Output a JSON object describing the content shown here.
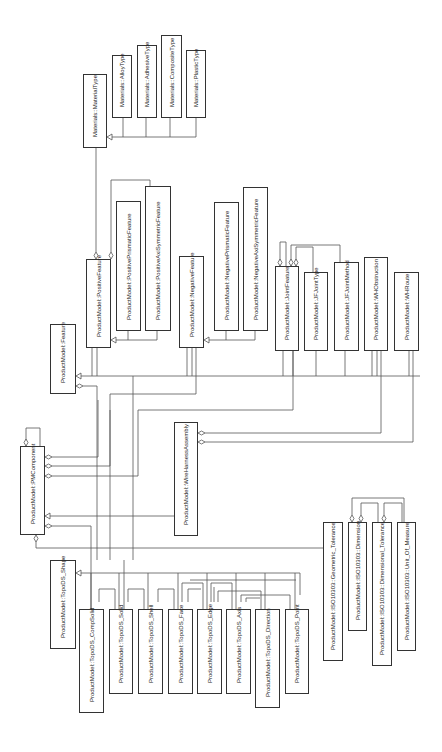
{
  "diagram": {
    "type": "UML class diagram (rotated 90 degrees)",
    "classes": [
      {
        "id": "materialtype",
        "label": "Materials::MaterialType",
        "x": 83,
        "y": 74,
        "w": 24,
        "h": 74
      },
      {
        "id": "alloytype",
        "label": "Materials::AlloyType",
        "x": 112,
        "y": 55,
        "w": 20,
        "h": 63
      },
      {
        "id": "adhesivetype",
        "label": "Materials::AdhesiveType",
        "x": 137,
        "y": 45,
        "w": 20,
        "h": 73
      },
      {
        "id": "compositetype",
        "label": "Materials::CompositeType",
        "x": 161,
        "y": 35,
        "w": 21,
        "h": 83
      },
      {
        "id": "plastictype",
        "label": "Materials::PlasticType",
        "x": 186,
        "y": 50,
        "w": 20,
        "h": 68
      },
      {
        "id": "positivefeature",
        "label": "ProductModel::PositiveFeature",
        "x": 86,
        "y": 259,
        "w": 25,
        "h": 89
      },
      {
        "id": "positiveprismatic",
        "label": "ProductModel::PositivePrismaticFeature",
        "x": 116,
        "y": 201,
        "w": 25,
        "h": 130
      },
      {
        "id": "positiveaxisym",
        "label": "ProductModel::PositiveAxiSymmetricFeature",
        "x": 145,
        "y": 186,
        "w": 26,
        "h": 145
      },
      {
        "id": "negativefeature",
        "label": "ProductModel::NegativeFeature",
        "x": 179,
        "y": 256,
        "w": 25,
        "h": 92
      },
      {
        "id": "negativeprismatic",
        "label": "ProductModel::NegativePrismaticFeature",
        "x": 214,
        "y": 202,
        "w": 25,
        "h": 129
      },
      {
        "id": "negativeaxisym",
        "label": "ProductModel::NegativeAxiSymmetricFeature",
        "x": 243,
        "y": 187,
        "w": 25,
        "h": 144
      },
      {
        "id": "feature",
        "label": "ProductModel::Feature",
        "x": 50,
        "y": 324,
        "w": 26,
        "h": 70
      },
      {
        "id": "jointfeature",
        "label": "ProductModel::JointFeature",
        "x": 275,
        "y": 266,
        "w": 24,
        "h": 85
      },
      {
        "id": "jfjointtype",
        "label": "ProductModel::JFJointType",
        "x": 304,
        "y": 272,
        "w": 24,
        "h": 79
      },
      {
        "id": "jfjointmethod",
        "label": "ProductModel::JFJointMethod",
        "x": 334,
        "y": 262,
        "w": 25,
        "h": 89
      },
      {
        "id": "whobstruction",
        "label": "ProductModel::WHObstruction",
        "x": 364,
        "y": 257,
        "w": 24,
        "h": 94
      },
      {
        "id": "whroute",
        "label": "ProductModel::WHRoute",
        "x": 394,
        "y": 272,
        "w": 25,
        "h": 79
      },
      {
        "id": "pmcomponent",
        "label": "ProductModel::PMComponent",
        "x": 20,
        "y": 446,
        "w": 25,
        "h": 89
      },
      {
        "id": "wireharness",
        "label": "ProductModel::WireHarnessAssembly",
        "x": 174,
        "y": 422,
        "w": 24,
        "h": 114
      },
      {
        "id": "topodsshape",
        "label": "ProductModel::TopoDS_Shape",
        "x": 50,
        "y": 560,
        "w": 26,
        "h": 89
      },
      {
        "id": "compsolid",
        "label": "ProductModel::TopoDS_CompSolid",
        "x": 79,
        "y": 609,
        "w": 25,
        "h": 104
      },
      {
        "id": "solid",
        "label": "ProductModel::TopoDS_Solid",
        "x": 109,
        "y": 609,
        "w": 24,
        "h": 85
      },
      {
        "id": "shell",
        "label": "ProductModel::TopoDS_Shell",
        "x": 138,
        "y": 609,
        "w": 25,
        "h": 85
      },
      {
        "id": "face",
        "label": "ProductModel::TopoDS_Face",
        "x": 168,
        "y": 609,
        "w": 25,
        "h": 85
      },
      {
        "id": "edge",
        "label": "ProductModel::TopoDS_Edge",
        "x": 197,
        "y": 609,
        "w": 25,
        "h": 85
      },
      {
        "id": "axis",
        "label": "ProductModel::TopoDS_Axis",
        "x": 226,
        "y": 609,
        "w": 25,
        "h": 85
      },
      {
        "id": "direction",
        "label": "ProductModel::TopoDS_Direction",
        "x": 255,
        "y": 609,
        "w": 25,
        "h": 99
      },
      {
        "id": "point",
        "label": "ProductModel::TopoDS_Point",
        "x": 285,
        "y": 609,
        "w": 24,
        "h": 85
      },
      {
        "id": "geomtol",
        "label": "ProductModel::ISO10303::Geometric_Tolerance",
        "x": 323,
        "y": 522,
        "w": 20,
        "h": 139
      },
      {
        "id": "dimension",
        "label": "ProductModel::ISO10303::Dimension",
        "x": 348,
        "y": 522,
        "w": 19,
        "h": 109
      },
      {
        "id": "dimtol",
        "label": "ProductModel::ISO10303::Dimensional_Tolerance",
        "x": 372,
        "y": 522,
        "w": 20,
        "h": 144
      },
      {
        "id": "unitofmeasure",
        "label": "ProductModel::ISO10303::Unit_Of_Measure",
        "x": 397,
        "y": 522,
        "w": 19,
        "h": 129
      }
    ]
  },
  "colors": {
    "line": "#444444",
    "box_border": "#333333",
    "background": "#ffffff"
  }
}
